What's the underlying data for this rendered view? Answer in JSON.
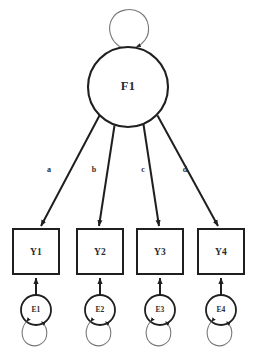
{
  "diagram": {
    "type": "sem-path-diagram",
    "background_color": "#ffffff",
    "stroke_color": "#1f1f1f",
    "text_color": "#2b2b2b",
    "latent_factor": {
      "id": "F1",
      "label": "F1",
      "shape": "circle",
      "variance_loop": "self-loop-circle-above"
    },
    "indicators": [
      {
        "id": "Y1",
        "label": "Y1",
        "shape": "rectangle"
      },
      {
        "id": "Y2",
        "label": "Y2",
        "shape": "rectangle"
      },
      {
        "id": "Y3",
        "label": "Y3",
        "shape": "rectangle"
      },
      {
        "id": "Y4",
        "label": "Y4",
        "shape": "rectangle"
      }
    ],
    "errors": [
      {
        "id": "E1",
        "label": "E1",
        "shape": "circle",
        "variance_loop": "self-loop-circle-below"
      },
      {
        "id": "E2",
        "label": "E2",
        "shape": "circle",
        "variance_loop": "self-loop-circle-below"
      },
      {
        "id": "E3",
        "label": "E3",
        "shape": "circle",
        "variance_loop": "self-loop-circle-below"
      },
      {
        "id": "E4",
        "label": "E4",
        "shape": "circle",
        "variance_loop": "self-loop-circle-below"
      }
    ],
    "loading_paths": [
      {
        "label": "a",
        "from": "F1",
        "to": "Y1"
      },
      {
        "label": "b",
        "from": "F1",
        "to": "Y2"
      },
      {
        "label": "c",
        "from": "F1",
        "to": "Y3"
      },
      {
        "label": "d",
        "from": "F1",
        "to": "Y4"
      }
    ],
    "error_paths": [
      {
        "from": "E1",
        "to": "Y1"
      },
      {
        "from": "E2",
        "to": "Y2"
      },
      {
        "from": "E3",
        "to": "Y3"
      },
      {
        "from": "E4",
        "to": "Y4"
      }
    ]
  }
}
